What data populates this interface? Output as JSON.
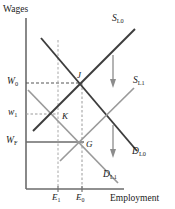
{
  "figure": {
    "title_y_axis": "Wages",
    "title_x_axis": "Employment",
    "type": "labor-market-supply-demand-diagram"
  },
  "axis_labels": {
    "y": "Wages",
    "x": "Employment"
  },
  "wage_ticks": [
    {
      "id": "w0",
      "label": "W",
      "sub": "0",
      "y_px": 83
    },
    {
      "id": "w1",
      "label": "w",
      "sub": "1",
      "y_px": 114
    },
    {
      "id": "wf",
      "label": "W",
      "sub": "F",
      "y_px": 142
    }
  ],
  "employment_ticks": [
    {
      "id": "e1",
      "label": "E",
      "sub": "1",
      "x_px": 58
    },
    {
      "id": "e0",
      "label": "E",
      "sub": "0",
      "x_px": 82
    }
  ],
  "curves": [
    {
      "id": "sl0",
      "label": "S",
      "sub": "L0",
      "kind": "supply",
      "color": "#3d3d3d"
    },
    {
      "id": "sl1",
      "label": "S",
      "sub": "L1",
      "kind": "supply",
      "color": "#9a9a9a"
    },
    {
      "id": "dl0",
      "label": "D",
      "sub": "L0",
      "kind": "demand",
      "color": "#3d3d3d"
    },
    {
      "id": "dl1",
      "label": "D",
      "sub": "L1",
      "kind": "demand",
      "color": "#9a9a9a"
    }
  ],
  "points": [
    {
      "id": "j",
      "label": "J",
      "x_px": 82,
      "y_px": 83
    },
    {
      "id": "k",
      "label": "K",
      "x_px": 58,
      "y_px": 114
    },
    {
      "id": "g",
      "label": "G",
      "x_px": 82,
      "y_px": 142
    }
  ],
  "arrows": [
    {
      "id": "supply-shift-arrow",
      "direction": "down"
    },
    {
      "id": "demand-shift-arrow",
      "direction": "down"
    }
  ],
  "colors": {
    "dark_curve": "#3d3d3d",
    "light_curve": "#9a9a9a",
    "axis": "#6b6b6b",
    "guide": "#8c8c8c",
    "text": "#1a1a1a"
  }
}
